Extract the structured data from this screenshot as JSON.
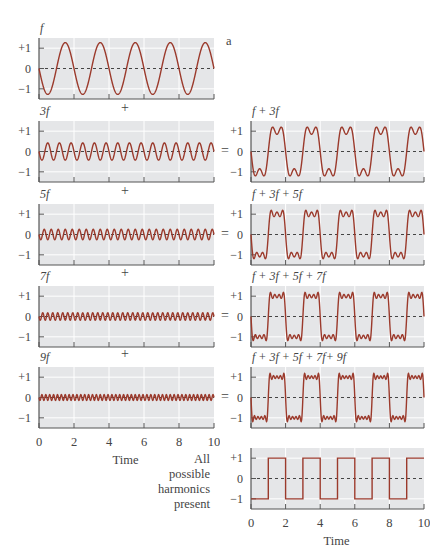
{
  "figure": {
    "panel_letter": "a",
    "plus_sign": "+",
    "equals_sign": "=",
    "side_label": [
      "All",
      "possible",
      "harmonics",
      "present"
    ],
    "x_axis_label": "Time"
  },
  "colors": {
    "curve": "#9b3a2c",
    "plot_bg": "#e5e6e8",
    "grid": "#ffffff",
    "axis": "#555555",
    "zero_line": "#444444"
  },
  "chart_data": [
    {
      "id": "f",
      "type": "line",
      "title": "f",
      "harmonics": [
        1
      ],
      "xlim": [
        0,
        10
      ],
      "ylim": [
        -1.5,
        1.5
      ],
      "yticks": [
        "+1",
        "0",
        "−1"
      ],
      "xticks": [],
      "column": "left",
      "row": 0
    },
    {
      "id": "3f",
      "type": "line",
      "title": "3f",
      "harmonics": [
        3
      ],
      "only": true,
      "xlim": [
        0,
        10
      ],
      "ylim": [
        -1.5,
        1.5
      ],
      "yticks": [
        "+1",
        "0",
        "−1"
      ],
      "xticks": [],
      "column": "left",
      "row": 1
    },
    {
      "id": "5f",
      "type": "line",
      "title": "5f",
      "harmonics": [
        5
      ],
      "only": true,
      "xlim": [
        0,
        10
      ],
      "ylim": [
        -1.5,
        1.5
      ],
      "yticks": [
        "+1",
        "0",
        "−1"
      ],
      "xticks": [],
      "column": "left",
      "row": 2
    },
    {
      "id": "7f",
      "type": "line",
      "title": "7f",
      "harmonics": [
        7
      ],
      "only": true,
      "xlim": [
        0,
        10
      ],
      "ylim": [
        -1.5,
        1.5
      ],
      "yticks": [
        "+1",
        "0",
        "−1"
      ],
      "xticks": [],
      "column": "left",
      "row": 3
    },
    {
      "id": "9f",
      "type": "line",
      "title": "9f",
      "harmonics": [
        9
      ],
      "only": true,
      "xlim": [
        0,
        10
      ],
      "ylim": [
        -1.5,
        1.5
      ],
      "yticks": [
        "+1",
        "0",
        "−1"
      ],
      "xticks": [
        "0",
        "2",
        "4",
        "6",
        "8",
        "10"
      ],
      "xlabel": "Time",
      "column": "left",
      "row": 4
    },
    {
      "id": "f+3f",
      "type": "line",
      "title": "f + 3f",
      "harmonics": [
        1,
        3
      ],
      "xlim": [
        0,
        10
      ],
      "ylim": [
        -1.5,
        1.5
      ],
      "yticks": [
        "+1",
        "0",
        "−1"
      ],
      "xticks": [],
      "column": "right",
      "row": 1
    },
    {
      "id": "f+3f+5f",
      "type": "line",
      "title": "f + 3f + 5f",
      "harmonics": [
        1,
        3,
        5
      ],
      "xlim": [
        0,
        10
      ],
      "ylim": [
        -1.5,
        1.5
      ],
      "yticks": [
        "+1",
        "0",
        "−1"
      ],
      "xticks": [],
      "column": "right",
      "row": 2
    },
    {
      "id": "f+3f+5f+7f",
      "type": "line",
      "title": "f + 3f + 5f + 7f",
      "harmonics": [
        1,
        3,
        5,
        7
      ],
      "xlim": [
        0,
        10
      ],
      "ylim": [
        -1.5,
        1.5
      ],
      "yticks": [
        "+1",
        "0",
        "−1"
      ],
      "xticks": [],
      "column": "right",
      "row": 3
    },
    {
      "id": "f+3f+5f+7f+9f",
      "type": "line",
      "title": "f + 3f + 5f + 7f+ 9f",
      "harmonics": [
        1,
        3,
        5,
        7,
        9
      ],
      "xlim": [
        0,
        10
      ],
      "ylim": [
        -1.5,
        1.5
      ],
      "yticks": [
        "+1",
        "0",
        "−1"
      ],
      "xticks": [],
      "column": "right",
      "row": 4
    },
    {
      "id": "square",
      "type": "line",
      "title": "",
      "square_wave": true,
      "period": 2,
      "x": [
        0,
        1,
        1,
        2,
        2,
        3,
        3,
        4,
        4,
        5,
        5,
        6,
        6,
        7,
        7,
        8,
        8,
        9,
        9,
        10
      ],
      "y": [
        -1,
        -1,
        1,
        1,
        -1,
        -1,
        1,
        1,
        -1,
        -1,
        1,
        1,
        -1,
        -1,
        1,
        1,
        -1,
        -1,
        1,
        1
      ],
      "xlim": [
        0,
        10
      ],
      "ylim": [
        -1.5,
        1.5
      ],
      "yticks": [
        "+1",
        "0",
        "−1"
      ],
      "xticks": [
        "0",
        "2",
        "4",
        "6",
        "8",
        "10"
      ],
      "xlabel": "Time",
      "column": "right",
      "row": 5
    }
  ]
}
